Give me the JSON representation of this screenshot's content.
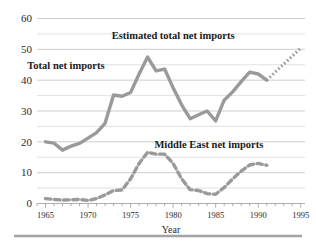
{
  "chart_data": {
    "type": "line",
    "title": "",
    "xlabel": "Year",
    "ylabel": "",
    "xlim": [
      1964,
      1995.5
    ],
    "ylim": [
      0,
      60
    ],
    "grid": true,
    "grid_major_step": 10,
    "grid_minor_step": 5,
    "legend_position": "inline-annotations",
    "xticks": [
      1965,
      1970,
      1975,
      1980,
      1985,
      1990,
      1995
    ],
    "xtick_labels": [
      "1965",
      "1970",
      "1975",
      "1980",
      "1985",
      "1990",
      "1995"
    ],
    "xminor_tick_step": 1,
    "yticks": [
      0,
      10,
      20,
      30,
      40,
      50,
      60
    ],
    "ytick_labels": [
      "0",
      "10",
      "20",
      "30",
      "40",
      "50",
      "60"
    ],
    "series": [
      {
        "name": "Total net imports",
        "style": "solid",
        "color": "#9a9a9a",
        "x": [
          1965,
          1966,
          1967,
          1968,
          1969,
          1970,
          1971,
          1972,
          1973,
          1974,
          1975,
          1976,
          1977,
          1978,
          1979,
          1980,
          1981,
          1982,
          1983,
          1984,
          1985,
          1986,
          1987,
          1988,
          1989,
          1990,
          1991
        ],
        "values": [
          20.0,
          19.6,
          17.3,
          18.6,
          19.5,
          21.2,
          23.0,
          26.0,
          35.2,
          34.8,
          36.0,
          42.0,
          47.5,
          43.0,
          43.6,
          37.5,
          32.0,
          27.5,
          28.8,
          30.0,
          26.8,
          33.5,
          36.2,
          39.5,
          42.6,
          42.0,
          40.0
        ]
      },
      {
        "name": "Estimated total net imports",
        "style": "dotted-projection",
        "color": "#9a9a9a",
        "x": [
          1991,
          1992,
          1993,
          1994,
          1995
        ],
        "values": [
          40.0,
          42.6,
          45.2,
          47.8,
          50.4
        ]
      },
      {
        "name": "Middle East net imports",
        "style": "dashed",
        "color": "#9a9a9a",
        "x": [
          1965,
          1966,
          1967,
          1968,
          1969,
          1970,
          1971,
          1972,
          1973,
          1974,
          1975,
          1976,
          1977,
          1978,
          1979,
          1980,
          1981,
          1982,
          1983,
          1984,
          1985,
          1986,
          1987,
          1988,
          1989,
          1990,
          1991
        ],
        "values": [
          1.6,
          1.3,
          1.1,
          1.2,
          1.3,
          1.0,
          1.6,
          2.8,
          4.2,
          4.4,
          8.0,
          13.0,
          16.6,
          16.0,
          16.0,
          13.0,
          8.0,
          4.5,
          4.2,
          3.2,
          3.0,
          5.2,
          8.0,
          10.5,
          12.5,
          13.0,
          12.4
        ]
      }
    ],
    "annotations": [
      {
        "text": "Estimated total net imports",
        "x": 1980.0,
        "y": 53.5
      },
      {
        "text": "Total net imports",
        "x": 1967.4,
        "y": 43.5
      },
      {
        "text": "Middle East net imports",
        "x": 1984.2,
        "y": 18.0
      }
    ]
  },
  "colors": {
    "series_gray": "#9a9a9a",
    "gridline": "#b9b9b9",
    "gridline_minor": "#cfcfcf",
    "text": "#2b2b2b",
    "bottom_rule": "#a3a3a3",
    "background": "#ffffff"
  },
  "axis": {
    "x_title": "Year"
  }
}
